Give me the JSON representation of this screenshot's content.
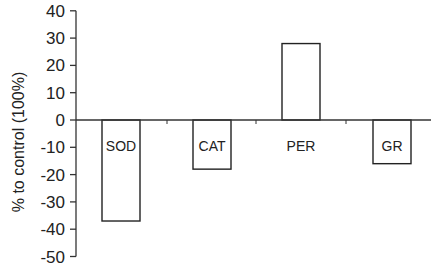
{
  "chart_data": {
    "type": "bar",
    "title": "",
    "xlabel": "",
    "ylabel": "% to control (100%)",
    "ylim": [
      -50,
      40
    ],
    "yticks": [
      40,
      30,
      20,
      10,
      0,
      -10,
      -20,
      -30,
      -40,
      -50
    ],
    "categories": [
      "SOD",
      "CAT",
      "PER",
      "GR"
    ],
    "values": [
      -37,
      -18,
      28,
      -16
    ],
    "grid": false,
    "legend": null,
    "bar_fill": "#ffffff",
    "bar_stroke": "#222222"
  }
}
